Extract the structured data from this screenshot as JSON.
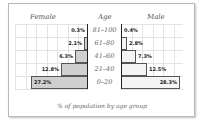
{
  "chart_data": {
    "type": "bar",
    "orientation": "horizontal",
    "subtype": "population-pyramid",
    "title": "",
    "caption": "% of population by age group",
    "center_label": "Age",
    "categories": [
      "81–100",
      "61–80",
      "41–60",
      "21–40",
      "0–20"
    ],
    "series": [
      {
        "name": "Female",
        "values": [
          0.3,
          2.1,
          6.3,
          12.8,
          27.2
        ],
        "labels": [
          "0.3%",
          "2.1%",
          "6.3%",
          "12.8%",
          "27.2%"
        ],
        "color": "#cfcfcf",
        "side": "left"
      },
      {
        "name": "Male",
        "values": [
          0.4,
          2.8,
          7.3,
          12.5,
          28.3
        ],
        "labels": [
          "0.4%",
          "2.8%",
          "7.3%",
          "12.5%",
          "28.3%"
        ],
        "color": "#f4f4f4",
        "side": "right"
      }
    ],
    "xlabel": "% of population by age group",
    "ylabel": "Age",
    "grid": true,
    "legend": "column headers"
  },
  "headers": {
    "female": "Female",
    "age": "Age",
    "male": "Male"
  },
  "caption": "% of population by age group"
}
